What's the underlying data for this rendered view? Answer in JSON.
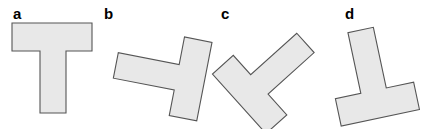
{
  "figure": {
    "width": 423,
    "height": 129,
    "background_color": "#ffffff",
    "shape_fill_color": "#e8e8e8",
    "shape_stroke_color": "#555555",
    "label_color": "#000000"
  },
  "panels": [
    {
      "label": "a",
      "label_x": 13,
      "label_y": 19,
      "shape_name": "t-shape-a",
      "description": "upright T, crossbar on top, stem pointing down",
      "rotation_degrees": 0,
      "center_x": 53,
      "center_y": 68,
      "points": "-41,-45 39,-45 39,-17 13,-17 13,45 -13,45 -13,-17 -41,-17"
    },
    {
      "label": "b",
      "label_x": 104,
      "label_y": 19,
      "shape_name": "t-shape-b",
      "description": "T rotated about 100 degrees clockwise, crossbar vertical at left, stem pointing right",
      "rotation_degrees": 101,
      "center_x": 160,
      "center_y": 74,
      "points": "-41,-45 39,-45 39,-17 13,-17 13,45 -13,45 -13,-17 -41,-17"
    },
    {
      "label": "c",
      "label_x": 221,
      "label_y": 19,
      "shape_name": "t-shape-c",
      "description": "T rotated about 228 degrees, crossbar running upper-left to lower-right, stem pointing upper-right",
      "rotation_degrees": 228,
      "center_x": 272,
      "center_y": 73,
      "points": "-41,-45 39,-45 39,-17 13,-17 13,45 -13,45 -13,-17 -41,-17"
    },
    {
      "label": "d",
      "label_x": 345,
      "label_y": 19,
      "shape_name": "t-shape-d",
      "description": "T rotated about 168 degrees, crossbar at bottom, stem pointing up and slightly right",
      "rotation_degrees": 168,
      "center_x": 370,
      "center_y": 74,
      "points": "-41,-45 39,-45 39,-17 13,-17 13,45 -13,45 -13,-17 -41,-17"
    }
  ]
}
